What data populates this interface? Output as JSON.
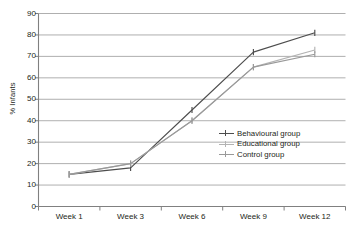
{
  "chart_data": {
    "type": "line",
    "title": "",
    "subtitle": "",
    "xlabel": "",
    "ylabel": "% Infants",
    "categories": [
      "Week 1",
      "Week 3",
      "Week 6",
      "Week 9",
      "Week 12"
    ],
    "ylim": [
      0,
      90
    ],
    "ytick_step": 10,
    "yticks": [
      90,
      80,
      70,
      60,
      50,
      40,
      30,
      20,
      10,
      0
    ],
    "grid": "horizontal",
    "legend_position": "inside-right-middle",
    "series": [
      {
        "name": "Behavioural group",
        "color": "#4d4d4d",
        "marker": "tick",
        "values": [
          15,
          18,
          45,
          72,
          81
        ]
      },
      {
        "name": "Educational group",
        "color": "#b3b3b3",
        "marker": "tick",
        "values": [
          15,
          20,
          40,
          65,
          73
        ]
      },
      {
        "name": "Control group",
        "color": "#999999",
        "marker": "tick",
        "values": [
          15,
          20,
          40,
          65,
          71
        ]
      }
    ]
  },
  "axes": {
    "y_title": "% Infants",
    "y_labels": [
      "90",
      "80",
      "70",
      "60",
      "50",
      "40",
      "30",
      "20",
      "10",
      "0"
    ],
    "x_labels": [
      "Week 1",
      "Week 3",
      "Week 6",
      "Week 9",
      "Week 12"
    ]
  },
  "legend": {
    "items": [
      {
        "label": "Behavioural group",
        "color": "#4d4d4d"
      },
      {
        "label": "Educational group",
        "color": "#b3b3b3"
      },
      {
        "label": "Control group",
        "color": "#999999"
      }
    ]
  },
  "colors": {
    "background": "#ffffff",
    "axis": "#808080",
    "gridline": "#a6a6a6",
    "text": "#231f20"
  }
}
